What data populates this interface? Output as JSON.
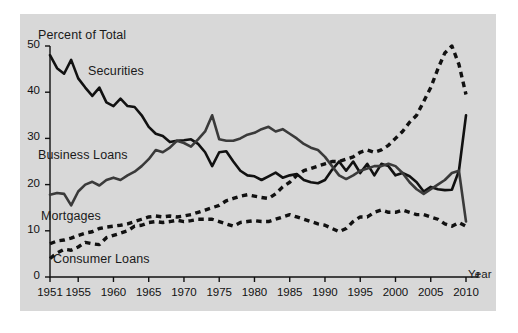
{
  "chart_data": {
    "type": "line",
    "title": "",
    "subtitle": "",
    "ylabel": "Percent of Total",
    "xlabel": "Year",
    "xlim": [
      1951,
      2010
    ],
    "ylim": [
      0,
      50
    ],
    "yticks": [
      0,
      10,
      20,
      30,
      40,
      50
    ],
    "xticks": [
      1951,
      1955,
      1960,
      1965,
      1970,
      1975,
      1980,
      1985,
      1990,
      1995,
      2000,
      2005,
      2010
    ],
    "grid": false,
    "legend_position": "inline-annotations",
    "annotations": [
      {
        "text": "Securities",
        "x": 1958,
        "y": 44.5
      },
      {
        "text": "Business Loans",
        "x": 1951.5,
        "y": 25.0
      },
      {
        "text": "Mortgages",
        "x": 1952.0,
        "y": 11.8
      },
      {
        "text": "Consumer Loans",
        "x": 1954.0,
        "y": 2.6
      }
    ],
    "x": [
      1951,
      1952,
      1953,
      1954,
      1955,
      1956,
      1957,
      1958,
      1959,
      1960,
      1961,
      1962,
      1963,
      1964,
      1965,
      1966,
      1967,
      1968,
      1969,
      1970,
      1971,
      1972,
      1973,
      1974,
      1975,
      1976,
      1977,
      1978,
      1979,
      1980,
      1981,
      1982,
      1983,
      1984,
      1985,
      1986,
      1987,
      1988,
      1989,
      1990,
      1991,
      1992,
      1993,
      1994,
      1995,
      1996,
      1997,
      1998,
      1999,
      2000,
      2001,
      2002,
      2003,
      2004,
      2005,
      2006,
      2007,
      2008,
      2009,
      2010
    ],
    "series": [
      {
        "name": "Securities",
        "style": "solid",
        "color": "#111111",
        "values": [
          48.0,
          45.2,
          44.0,
          47.0,
          43.0,
          41.0,
          39.2,
          41.0,
          37.8,
          37.0,
          38.6,
          37.0,
          36.8,
          35.0,
          32.5,
          31.0,
          30.5,
          29.2,
          29.5,
          29.6,
          29.8,
          28.8,
          27.0,
          24.0,
          27.0,
          27.2,
          25.0,
          23.0,
          22.0,
          21.8,
          21.0,
          21.8,
          22.6,
          21.5,
          22.0,
          22.3,
          21.0,
          20.5,
          20.3,
          21.0,
          23.2,
          25.0,
          23.0,
          25.0,
          22.5,
          24.5,
          22.0,
          24.5,
          24.0,
          22.0,
          22.5,
          21.8,
          20.5,
          18.5,
          19.5,
          19.0,
          18.8,
          18.9,
          23.0,
          35.0
        ]
      },
      {
        "name": "Business Loans",
        "style": "solid",
        "color": "#3a3a3a",
        "values": [
          17.8,
          18.2,
          18.0,
          15.5,
          18.5,
          20.0,
          20.6,
          19.8,
          21.0,
          21.5,
          21.0,
          22.0,
          22.8,
          24.0,
          25.5,
          27.5,
          27.0,
          28.0,
          29.5,
          29.0,
          28.2,
          29.8,
          31.5,
          35.0,
          29.8,
          29.5,
          29.5,
          30.0,
          30.8,
          31.2,
          32.0,
          32.5,
          31.5,
          32.0,
          31.0,
          30.0,
          28.8,
          28.0,
          27.5,
          26.0,
          24.0,
          22.0,
          21.2,
          22.0,
          23.0,
          23.5,
          24.0,
          24.0,
          24.5,
          24.0,
          22.5,
          20.5,
          19.0,
          18.0,
          19.0,
          20.0,
          21.0,
          22.5,
          23.0,
          12.0
        ]
      },
      {
        "name": "Mortgages",
        "style": "dashed",
        "color": "#111111",
        "values": [
          7.2,
          7.8,
          8.0,
          8.4,
          9.0,
          9.5,
          9.8,
          10.5,
          10.8,
          11.0,
          11.2,
          11.5,
          12.0,
          12.5,
          13.0,
          13.2,
          13.0,
          13.2,
          13.0,
          13.2,
          13.5,
          14.0,
          14.5,
          15.0,
          15.5,
          16.5,
          17.0,
          17.5,
          17.8,
          17.5,
          17.2,
          17.0,
          18.0,
          19.5,
          20.5,
          22.0,
          23.0,
          23.5,
          24.0,
          24.5,
          25.0,
          25.0,
          25.5,
          26.0,
          27.0,
          27.5,
          27.0,
          27.5,
          28.5,
          30.0,
          31.5,
          33.5,
          35.0,
          38.0,
          41.0,
          45.0,
          48.5,
          50.0,
          46.0,
          39.5
        ]
      },
      {
        "name": "Consumer Loans",
        "style": "dashed",
        "color": "#111111",
        "values": [
          4.0,
          5.2,
          6.0,
          5.8,
          6.5,
          7.5,
          7.2,
          7.0,
          8.5,
          9.0,
          9.5,
          10.0,
          11.0,
          11.2,
          11.8,
          12.0,
          11.8,
          12.0,
          12.3,
          12.0,
          12.2,
          12.5,
          12.5,
          12.5,
          12.0,
          11.5,
          11.0,
          11.8,
          12.0,
          12.2,
          12.0,
          12.0,
          12.5,
          13.0,
          13.5,
          13.0,
          12.5,
          12.0,
          11.5,
          11.2,
          10.5,
          9.8,
          10.5,
          12.0,
          13.0,
          13.0,
          14.0,
          14.5,
          14.0,
          14.0,
          14.5,
          14.0,
          13.5,
          13.5,
          13.0,
          12.5,
          11.5,
          11.0,
          11.8,
          11.0
        ]
      }
    ]
  }
}
